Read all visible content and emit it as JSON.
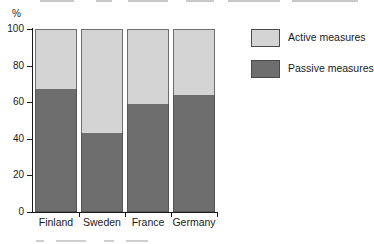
{
  "chart_data": {
    "type": "bar",
    "subtype": "stacked-100-percent",
    "title": "",
    "subtitle": "",
    "xlabel": "",
    "ylabel": "",
    "yunit": "%",
    "categories": [
      "Finland",
      "Sweden",
      "France",
      "Germany"
    ],
    "series": [
      {
        "name": "Passive measures",
        "color": "#6e6e6e",
        "values": [
          67,
          43,
          59,
          64
        ]
      },
      {
        "name": "Active measures",
        "color": "#d4d4d4",
        "values": [
          33,
          57,
          41,
          36
        ]
      }
    ],
    "ylim": [
      0,
      100
    ],
    "yticks": [
      0,
      20,
      40,
      60,
      80,
      100
    ],
    "ytick_labels": [
      "0",
      "20",
      "40",
      "60",
      "80",
      "100"
    ],
    "grid": false,
    "legend_position": "right",
    "legend_entries": [
      {
        "label": "Active measures",
        "color": "#d4d4d4"
      },
      {
        "label": "Passive measures",
        "color": "#6e6e6e"
      }
    ]
  },
  "axis": {
    "unit_label": "%"
  },
  "colors": {
    "active": "#d4d4d4",
    "passive": "#6e6e6e",
    "axis": "#1a1a1a",
    "outline": "#555555",
    "background": "#ffffff"
  }
}
